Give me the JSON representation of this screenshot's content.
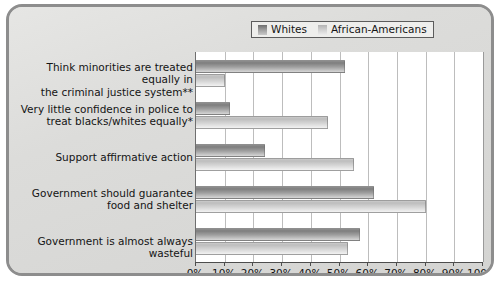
{
  "legend": {
    "entries": [
      {
        "label": "Whites",
        "swatch": "legend-swatch-whites",
        "color": "#8e8e8e"
      },
      {
        "label": "African-Americans",
        "swatch": "legend-swatch-african-americans",
        "color": "#cacaca"
      }
    ]
  },
  "chart_data": {
    "type": "bar",
    "orientation": "horizontal",
    "title": "",
    "subtitle": "",
    "xlabel": "",
    "ylabel": "",
    "xlim": [
      0,
      100
    ],
    "xtick_labels": [
      "0%",
      "10%",
      "20%",
      "30%",
      "40%",
      "50%",
      "60%",
      "70%",
      "80%",
      "90%",
      "100%"
    ],
    "xticks": [
      0,
      10,
      20,
      30,
      40,
      50,
      60,
      70,
      80,
      90,
      100
    ],
    "grid": true,
    "grid_axis": "x",
    "legend_position": "top-right",
    "categories": [
      "Think minorities are treated equally in\nthe criminal justice system**",
      "Very little confidence in police to\ntreat blacks/whites equally*",
      "Support affirmative action",
      "Government should guarantee\nfood and shelter",
      "Government is almost always wasteful"
    ],
    "series": [
      {
        "name": "Whites",
        "color": "#8e8e8e",
        "values": [
          52,
          12,
          24,
          62,
          57
        ]
      },
      {
        "name": "African-Americans",
        "color": "#cacaca",
        "values": [
          10,
          46,
          55,
          80,
          53
        ]
      }
    ],
    "annotations": [
      "*",
      "**"
    ]
  },
  "colors": {
    "frame_border": "#8d8d8d",
    "frame_background": "#dcdcda",
    "plot_background": "#ffffff",
    "gridline": "#bdbdbd",
    "axis": "#4d4d4d",
    "text": "#141414"
  }
}
